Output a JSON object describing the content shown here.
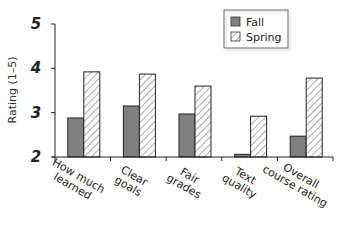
{
  "chart_data": {
    "type": "bar",
    "title": "",
    "xlabel": "",
    "ylabel": "Rating (1–5)",
    "ylim": [
      2,
      5
    ],
    "yticks": [
      2,
      3,
      4,
      5
    ],
    "grid": false,
    "legend_position": "top-right",
    "categories": [
      [
        "How much",
        "learned"
      ],
      [
        "Clear",
        "goals"
      ],
      [
        "Fair",
        "grades"
      ],
      [
        "Text",
        "quality"
      ],
      [
        "Overall",
        "course rating"
      ]
    ],
    "series": [
      {
        "name": "Fall",
        "pattern": "solid",
        "color": "#808080",
        "values": [
          2.88,
          3.15,
          2.97,
          2.06,
          2.47
        ]
      },
      {
        "name": "Spring",
        "pattern": "hatched",
        "color": "#ffffff",
        "values": [
          3.92,
          3.87,
          3.6,
          2.92,
          3.78
        ]
      }
    ]
  },
  "legend": {
    "items": [
      {
        "label": "Fall"
      },
      {
        "label": "Spring"
      }
    ]
  }
}
